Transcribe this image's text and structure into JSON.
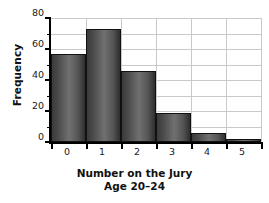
{
  "chart_data": {
    "type": "bar",
    "title": "",
    "subtitle": "",
    "xlabel": "Number on the Jury",
    "xlabel_sub": "Age 20–24",
    "ylabel": "Frequency",
    "categories": [
      "0",
      "1",
      "2",
      "3",
      "4",
      "5"
    ],
    "values": [
      57,
      73,
      46,
      19,
      6,
      2
    ],
    "series": [
      {
        "name": "Frequency",
        "values": [
          57,
          73,
          46,
          19,
          6,
          2
        ]
      }
    ],
    "ylim": [
      0,
      80
    ],
    "xlim": [
      -0.5,
      5.5
    ],
    "ytick_labels": [
      "0",
      "20",
      "40",
      "60",
      "80"
    ],
    "ytick_values": [
      0,
      20,
      40,
      60,
      80
    ],
    "yminor_values": [
      10,
      30,
      50,
      70
    ],
    "xtick_labels": [
      "0",
      "1",
      "2",
      "3",
      "4",
      "5"
    ],
    "grid": "horizontal-and-vertical",
    "legend": "none",
    "bar_color": "#555555",
    "bar_edge_color": "#111111",
    "grid_color": "#c9c9c9",
    "axis_color": "#000000",
    "background_color": "#ffffff"
  }
}
